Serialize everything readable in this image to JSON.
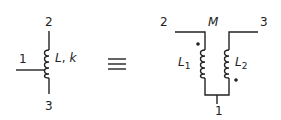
{
  "diagram": {
    "left": {
      "terminal_top": "2",
      "terminal_tap": "1",
      "terminal_bottom": "3",
      "label_L": "L",
      "label_sep": ",",
      "label_k": "k"
    },
    "equivalence_symbol": "≡",
    "right": {
      "terminal_left": "2",
      "mutual_label": "M",
      "terminal_right": "3",
      "terminal_bottom": "1",
      "inductor1_label": "L",
      "inductor1_sub": "1",
      "inductor2_label": "L",
      "inductor2_sub": "2",
      "dot_markers": [
        "dot-L1-top",
        "dot-L2-bottom"
      ]
    },
    "colors": {
      "ink": "#222222",
      "background": "#ffffff"
    }
  }
}
